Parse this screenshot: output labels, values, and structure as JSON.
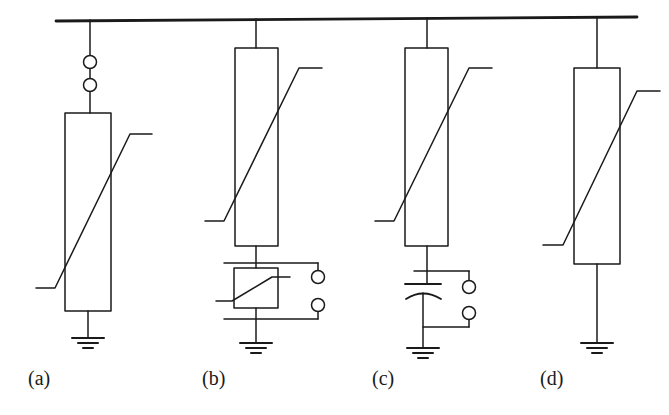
{
  "figure": {
    "width": 669,
    "height": 415,
    "background_color": "#ffffff",
    "line_color": "#1a1a1a",
    "busbar": {
      "name": "busbar",
      "x_start": 56,
      "x_end": 637,
      "y_start": 21,
      "y_end": 17,
      "stroke_width": 2.6
    }
  },
  "captions": [
    {
      "id": "a",
      "label": "(a)",
      "x": 28,
      "y": 368
    },
    {
      "id": "b",
      "label": "(b)",
      "x": 202,
      "y": 368
    },
    {
      "id": "c",
      "label": "(c)",
      "x": 372,
      "y": 368
    },
    {
      "id": "d",
      "label": "(d)",
      "x": 540,
      "y": 368
    }
  ],
  "circuits": [
    {
      "id": "a",
      "name": "arrester-with-spark-gaps",
      "drop_x": 90,
      "busbar_y": 20,
      "components": [
        {
          "type": "spark-gap-circle",
          "cx": 90,
          "cy": 62,
          "r": 6.5
        },
        {
          "type": "spark-gap-circle",
          "cx": 90,
          "cy": 85,
          "r": 6.5
        },
        {
          "type": "arrester-block",
          "x": 65,
          "y": 113,
          "w": 46,
          "h": 198
        },
        {
          "type": "ground",
          "x": 88,
          "y": 338
        }
      ]
    },
    {
      "id": "b",
      "name": "arrester-with-counter-block",
      "drop_x": 256,
      "busbar_y": 19,
      "components": [
        {
          "type": "arrester-block",
          "x": 235,
          "y": 48,
          "w": 43,
          "h": 198
        },
        {
          "type": "counter-block",
          "x": 234,
          "y": 268,
          "w": 44,
          "h": 40
        },
        {
          "type": "terminal-circle",
          "cx": 318,
          "cy": 277,
          "r": 6.5
        },
        {
          "type": "terminal-circle",
          "cx": 318,
          "cy": 305,
          "r": 6.5
        },
        {
          "type": "ground",
          "x": 256,
          "y": 343
        }
      ]
    },
    {
      "id": "c",
      "name": "arrester-with-capacitor",
      "drop_x": 427,
      "busbar_y": 18,
      "components": [
        {
          "type": "arrester-block",
          "x": 405,
          "y": 48,
          "w": 43,
          "h": 198
        },
        {
          "type": "capacitor",
          "cx": 414,
          "cy": 288
        },
        {
          "type": "terminal-circle",
          "cx": 469,
          "cy": 287,
          "r": 6.5
        },
        {
          "type": "terminal-circle",
          "cx": 469,
          "cy": 313,
          "r": 6.5
        },
        {
          "type": "ground",
          "x": 414,
          "y": 348
        }
      ]
    },
    {
      "id": "d",
      "name": "arrester-direct-ground",
      "drop_x": 597,
      "busbar_y": 17,
      "components": [
        {
          "type": "arrester-block",
          "x": 574,
          "y": 68,
          "w": 46,
          "h": 196
        },
        {
          "type": "ground",
          "x": 597,
          "y": 343
        }
      ]
    }
  ]
}
